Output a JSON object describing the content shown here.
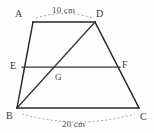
{
  "figure": {
    "kind": "trapezoid-with-midsegment",
    "background_color": "#fefefe",
    "stroke_color": "#272727",
    "dimension_arc_color": "#9a9a9a",
    "label_color": "#3a3a3a"
  },
  "vertices": {
    "A": {
      "label": "A",
      "x": 33,
      "y": 22,
      "label_x": 15,
      "label_y": 9
    },
    "D": {
      "label": "D",
      "x": 95,
      "y": 22,
      "label_x": 96,
      "label_y": 9
    },
    "B": {
      "label": "B",
      "x": 17,
      "y": 108,
      "label_x": 6,
      "label_y": 111
    },
    "C": {
      "label": "C",
      "x": 139,
      "y": 108,
      "label_x": 140,
      "label_y": 112
    },
    "E": {
      "label": "E",
      "x": 22,
      "y": 67,
      "label_x": 10,
      "label_y": 61
    },
    "F": {
      "label": "F",
      "x": 120,
      "y": 67,
      "label_x": 122,
      "label_y": 60
    },
    "G": {
      "label": "G",
      "x": 55,
      "y": 69,
      "label_x": 55,
      "label_y": 72
    }
  },
  "segments": [
    {
      "name": "side-AD-top",
      "from": "A",
      "to": "D"
    },
    {
      "name": "side-AB-left",
      "from": "A",
      "to": "B"
    },
    {
      "name": "side-DC-right",
      "from": "D",
      "to": "C"
    },
    {
      "name": "side-BC-bottom",
      "from": "B",
      "to": "C"
    },
    {
      "name": "midsegment-EF",
      "from": "E",
      "to": "F"
    },
    {
      "name": "diagonal-BD",
      "from": "B",
      "to": "D"
    }
  ],
  "dimensions": {
    "top": {
      "text": "10 cm",
      "value": 10,
      "unit": "cm",
      "measures": "AD",
      "label_x": 52,
      "label_y": 6,
      "arc": "M 36 18 Q 64 9 93 18"
    },
    "bottom": {
      "text": "20 cm",
      "value": 20,
      "unit": "cm",
      "measures": "BC",
      "label_x": 62,
      "label_y": 120,
      "arc": "M 22 114 Q 78 130 135 114"
    }
  }
}
